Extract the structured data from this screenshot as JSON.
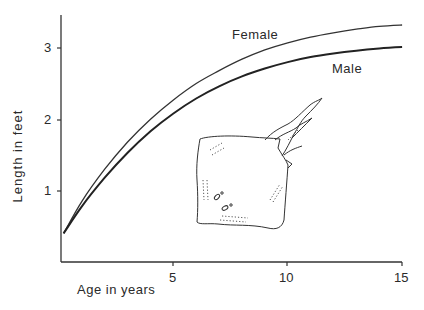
{
  "chart_data": {
    "type": "line",
    "title": "",
    "xlabel": "Age in years",
    "ylabel": "Length in feet",
    "xlim": [
      0,
      15
    ],
    "ylim": [
      0,
      3.45
    ],
    "x_ticks": [
      5,
      10,
      15
    ],
    "y_ticks": [
      1,
      2,
      3
    ],
    "grid": false,
    "legend": "inline labels",
    "x": [
      0.2,
      1,
      2,
      3,
      4,
      5,
      6,
      7,
      8,
      9,
      10,
      11,
      12,
      13,
      14,
      15
    ],
    "series": [
      {
        "name": "Female",
        "values": [
          0.4,
          0.85,
          1.3,
          1.68,
          2.0,
          2.27,
          2.5,
          2.68,
          2.84,
          2.97,
          3.07,
          3.15,
          3.21,
          3.26,
          3.3,
          3.32
        ]
      },
      {
        "name": "Male",
        "values": [
          0.4,
          0.78,
          1.18,
          1.53,
          1.83,
          2.08,
          2.29,
          2.46,
          2.6,
          2.71,
          2.8,
          2.87,
          2.92,
          2.96,
          2.99,
          3.01
        ]
      }
    ],
    "annotations": [
      "Female",
      "Male",
      "illustration of a skate (ray)"
    ]
  },
  "labels": {
    "xlabel": "Age in years",
    "ylabel": "Length in feet",
    "female": "Female",
    "male": "Male",
    "x_tick_5": "5",
    "x_tick_10": "10",
    "x_tick_15": "15",
    "y_tick_1": "1",
    "y_tick_2": "2",
    "y_tick_3": "3"
  }
}
